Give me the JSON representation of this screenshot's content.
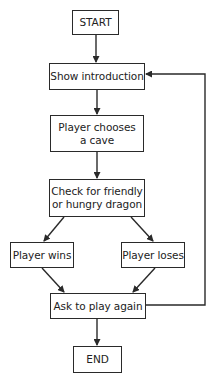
{
  "diagram": {
    "type": "flowchart",
    "nodes": [
      {
        "id": "start",
        "label": "START"
      },
      {
        "id": "intro",
        "label": "Show introduction"
      },
      {
        "id": "choose",
        "label": "Player chooses\na cave"
      },
      {
        "id": "check",
        "label": "Check for friendly\nor hungry dragon"
      },
      {
        "id": "wins",
        "label": "Player wins"
      },
      {
        "id": "loses",
        "label": "Player loses"
      },
      {
        "id": "again",
        "label": "Ask to play again"
      },
      {
        "id": "end",
        "label": "END"
      }
    ],
    "edges": [
      {
        "from": "start",
        "to": "intro"
      },
      {
        "from": "intro",
        "to": "choose"
      },
      {
        "from": "choose",
        "to": "check"
      },
      {
        "from": "check",
        "to": "wins"
      },
      {
        "from": "check",
        "to": "loses"
      },
      {
        "from": "wins",
        "to": "again"
      },
      {
        "from": "loses",
        "to": "again"
      },
      {
        "from": "again",
        "to": "end"
      },
      {
        "from": "again",
        "to": "intro"
      }
    ],
    "colors": {
      "stroke": "#2a2a2a",
      "background": "#ffffff",
      "text": "#222222"
    }
  }
}
